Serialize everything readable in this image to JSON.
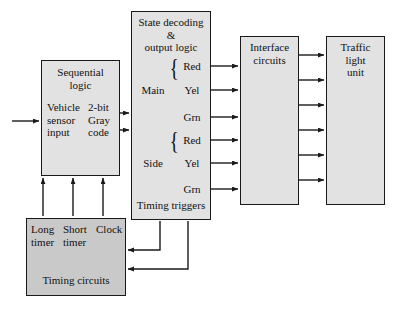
{
  "diagram": {
    "colors": {
      "block_fill": "#e2e2e2",
      "block_fill_dark": "#c9c9c9",
      "line": "#1a1a1a",
      "page_background": "#ffffff"
    },
    "blocks": {
      "sequential_logic": {
        "title": "Sequential\nlogic",
        "input_label": "Vehicle\nsensor\ninput",
        "output_label": "2-bit\nGray\ncode"
      },
      "state_decoding": {
        "title": "State decoding\n&\noutput logic",
        "footer_label": "Timing triggers",
        "groups": [
          {
            "name": "Main",
            "signals": [
              "Red",
              "Yel",
              "Grn"
            ]
          },
          {
            "name": "Side",
            "signals": [
              "Red",
              "Yel",
              "Grn"
            ]
          }
        ]
      },
      "interface_circuits": {
        "title": "Interface\ncircuits"
      },
      "traffic_light_unit": {
        "title": "Traffic\nlight\nunit"
      },
      "timing_circuits": {
        "title": "Timing circuits",
        "timers": [
          "Long\ntimer",
          "Short\ntimer",
          "Clock"
        ]
      }
    }
  }
}
